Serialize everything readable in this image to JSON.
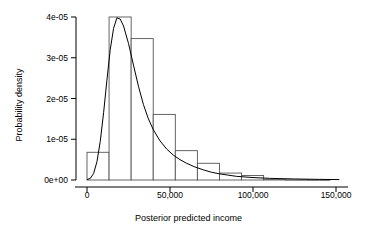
{
  "chart_data": {
    "type": "bar",
    "title": "",
    "subtitle": "",
    "xlabel": "Posterior predicted income",
    "ylabel": "Probability density",
    "xlim": [
      -3000,
      156000
    ],
    "ylim": [
      0,
      4.2e-05
    ],
    "grid": false,
    "legend": null,
    "annotations": [],
    "xticks": [
      0,
      50000,
      100000,
      150000
    ],
    "xtick_labels": [
      "0",
      "50,000",
      "100,000",
      "150,000"
    ],
    "yticks": [
      0,
      1e-05,
      2e-05,
      3e-05,
      4e-05
    ],
    "ytick_labels": [
      "0e+00",
      "1e-05",
      "2e-05",
      "3e-05",
      "4e-05"
    ],
    "bin_width": 13300,
    "bin_edges": [
      0,
      13300,
      26600,
      39900,
      53200,
      66500,
      79800,
      93100,
      106400,
      119700,
      133000,
      146300
    ],
    "categories": [
      "0-13,300",
      "13,300-26,600",
      "26,600-39,900",
      "39,900-53,200",
      "53,200-66,500",
      "66,500-79,800",
      "79,800-93,100",
      "93,100-106,400",
      "106,400-119,700",
      "119,700-133,000",
      "133,000-146,300"
    ],
    "values": [
      6.8e-06,
      4e-05,
      3.47e-05,
      1.61e-05,
      7.2e-06,
      4.1e-06,
      1.7e-06,
      1.1e-06,
      1e-07,
      5e-08,
      3e-08
    ],
    "series": [
      {
        "name": "histogram",
        "type": "bar",
        "values": [
          6.8e-06,
          4e-05,
          3.47e-05,
          1.61e-05,
          7.2e-06,
          4.1e-06,
          1.7e-06,
          1.1e-06,
          1e-07,
          5e-08,
          3e-08
        ]
      },
      {
        "name": "density",
        "type": "line",
        "x": [
          0,
          2000,
          4000,
          6000,
          8000,
          10000,
          12000,
          14000,
          16000,
          18000,
          20000,
          22000,
          25000,
          28000,
          31000,
          34000,
          37000,
          40000,
          44000,
          48000,
          52000,
          56000,
          60000,
          65000,
          70000,
          75000,
          80000,
          90000,
          100000,
          110000,
          125000,
          140000,
          152000
        ],
        "y": [
          1e-07,
          4e-07,
          1.6e-06,
          4.5e-06,
          9.5e-06,
          1.65e-05,
          2.45e-05,
          3.2e-05,
          3.72e-05,
          3.98e-05,
          3.95e-05,
          3.78e-05,
          3.35e-05,
          2.82e-05,
          2.3e-05,
          1.85e-05,
          1.5e-05,
          1.23e-05,
          9.6e-06,
          7.6e-06,
          6.1e-06,
          5e-06,
          4.1e-06,
          3.2e-06,
          2.5e-06,
          1.9e-06,
          1.5e-06,
          9e-07,
          6e-07,
          4e-07,
          2.5e-07,
          1.5e-07,
          1e-07
        ]
      }
    ],
    "colors": {
      "bar_stroke": "#555555",
      "bar_fill": "#ffffff",
      "density_line": "#000000",
      "axis": "#000000"
    }
  }
}
